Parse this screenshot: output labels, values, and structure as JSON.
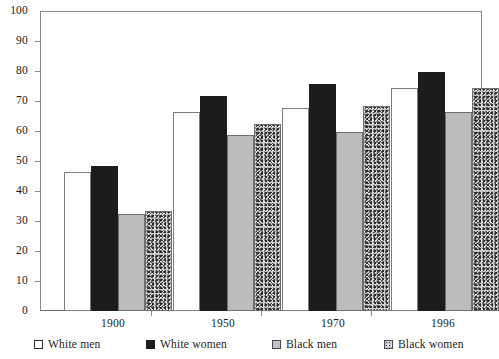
{
  "chart_data": {
    "type": "bar",
    "title": "",
    "subtitle": "",
    "xlabel": "",
    "ylabel": "",
    "categories": [
      "1900",
      "1950",
      "1970",
      "1996"
    ],
    "series": [
      {
        "name": "White men",
        "color": "#ffffff",
        "fill": "solid-white",
        "values": [
          46.5,
          66.5,
          68.0,
          74.5
        ]
      },
      {
        "name": "White women",
        "color": "#1c1c1c",
        "fill": "solid-black",
        "values": [
          48.5,
          72.0,
          76.0,
          80.0
        ]
      },
      {
        "name": "Black men",
        "color": "#bcbcbc",
        "fill": "light-gray",
        "values": [
          32.5,
          59.0,
          60.0,
          66.5
        ]
      },
      {
        "name": "Black women",
        "color": "#c8c8c8",
        "fill": "speckled",
        "values": [
          33.5,
          62.5,
          68.5,
          74.5
        ]
      }
    ],
    "ylim": [
      0,
      100
    ],
    "ytick_step": 10,
    "yticks": [
      "0",
      "10",
      "20",
      "30",
      "40",
      "50",
      "60",
      "70",
      "80",
      "90",
      "100"
    ],
    "grid": false,
    "legend_position": "bottom"
  },
  "legend": {
    "items": [
      {
        "label": "White men"
      },
      {
        "label": "White women"
      },
      {
        "label": "Black men"
      },
      {
        "label": "Black women"
      }
    ]
  }
}
